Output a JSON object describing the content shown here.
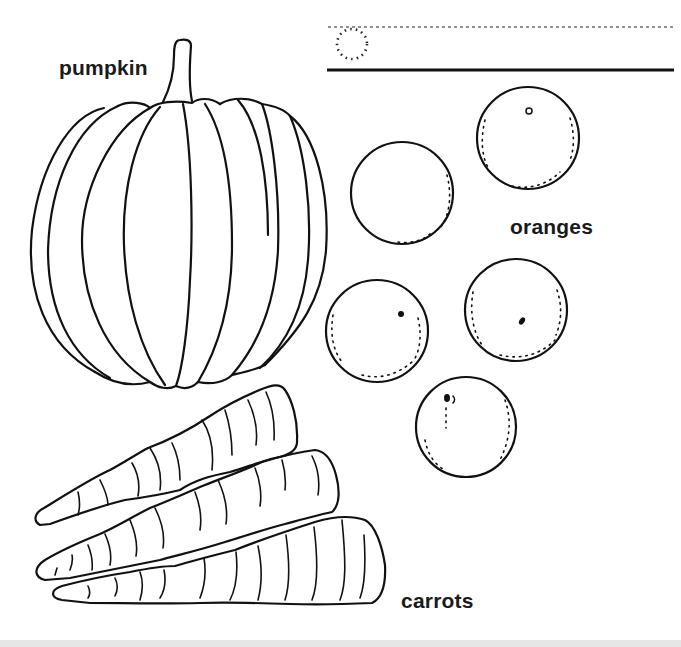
{
  "worksheet": {
    "name_line": {
      "dotted_circle_icon": "dotted-circle",
      "guide_lines": [
        "dashed-top-line",
        "solid-baseline"
      ]
    },
    "labels": {
      "pumpkin": "pumpkin",
      "oranges": "oranges",
      "carrots": "carrots"
    },
    "illustrations": [
      {
        "name": "pumpkin",
        "count": 1
      },
      {
        "name": "orange",
        "count": 5
      },
      {
        "name": "carrot",
        "count": 3
      }
    ],
    "colors": {
      "line": "#111111",
      "background": "#ffffff",
      "bottom_band": "#e6e6e6"
    }
  }
}
